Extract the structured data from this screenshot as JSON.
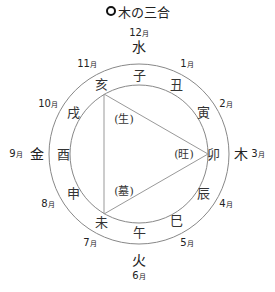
{
  "title": {
    "icon": "ring-bullet-icon",
    "text": "木の三合"
  },
  "diagram": {
    "center": [
      139,
      154
    ],
    "outer_radius": 90,
    "inner_radius": 69,
    "line_color": "#888888",
    "branches": [
      {
        "name": "子",
        "x": 139,
        "y": 75
      },
      {
        "name": "丑",
        "x": 176,
        "y": 84
      },
      {
        "name": "寅",
        "x": 203,
        "y": 112
      },
      {
        "name": "卯",
        "x": 213,
        "y": 154
      },
      {
        "name": "辰",
        "x": 203,
        "y": 193
      },
      {
        "name": "巳",
        "x": 176,
        "y": 220
      },
      {
        "name": "午",
        "x": 139,
        "y": 232
      },
      {
        "name": "未",
        "x": 101,
        "y": 222
      },
      {
        "name": "申",
        "x": 73,
        "y": 193
      },
      {
        "name": "酉",
        "x": 63,
        "y": 154
      },
      {
        "name": "戌",
        "x": 73,
        "y": 112
      },
      {
        "name": "亥",
        "x": 101,
        "y": 84
      }
    ],
    "elements": [
      {
        "name": "水",
        "x": 139,
        "y": 47
      },
      {
        "name": "木",
        "x": 241,
        "y": 154
      },
      {
        "name": "火",
        "x": 139,
        "y": 260
      },
      {
        "name": "金",
        "x": 37,
        "y": 154
      }
    ],
    "months": [
      {
        "num": "12",
        "unit": "月",
        "x": 139,
        "y": 33
      },
      {
        "num": "1",
        "unit": "月",
        "x": 187,
        "y": 64
      },
      {
        "num": "2",
        "unit": "月",
        "x": 226,
        "y": 104
      },
      {
        "num": "3",
        "unit": "月",
        "x": 258,
        "y": 154
      },
      {
        "num": "4",
        "unit": "月",
        "x": 226,
        "y": 204
      },
      {
        "num": "5",
        "unit": "月",
        "x": 187,
        "y": 243
      },
      {
        "num": "6",
        "unit": "月",
        "x": 139,
        "y": 276
      },
      {
        "num": "7",
        "unit": "月",
        "x": 90,
        "y": 243
      },
      {
        "num": "8",
        "unit": "月",
        "x": 48,
        "y": 204
      },
      {
        "num": "9",
        "unit": "月",
        "x": 16,
        "y": 154
      },
      {
        "num": "10",
        "unit": "月",
        "x": 48,
        "y": 104
      },
      {
        "num": "11",
        "unit": "月",
        "x": 87,
        "y": 64
      }
    ],
    "triangle": {
      "points": [
        [
          104,
          94
        ],
        [
          208,
          154
        ],
        [
          104,
          214
        ]
      ],
      "phases": [
        {
          "label": "(生)",
          "x": 124,
          "y": 119
        },
        {
          "label": "(旺)",
          "x": 184,
          "y": 154
        },
        {
          "label": "(墓)",
          "x": 124,
          "y": 191
        }
      ]
    }
  }
}
